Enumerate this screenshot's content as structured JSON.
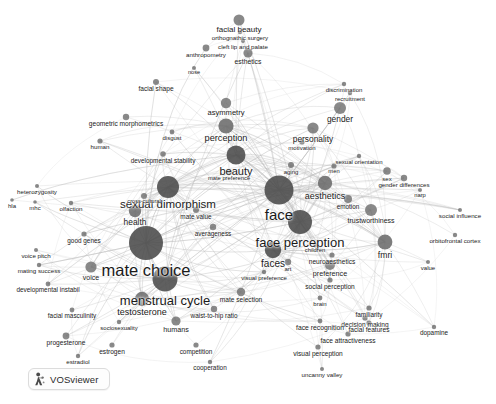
{
  "app": {
    "logo_label": "VOSviewer",
    "logo_icon": "vosviewer-logo-icon"
  },
  "canvas": {
    "width": 496,
    "height": 404,
    "background_color": "#ffffff",
    "node_color": "#6b6b6b",
    "node_color_dark": "#4a4a4a",
    "edge_color": "#b9b9b9",
    "label_color": "#1a1a1a"
  },
  "bottom_caption": "",
  "chart_data": {
    "type": "scatter",
    "title": "",
    "xlabel": "",
    "ylabel": "",
    "grid": false,
    "legend": "none",
    "xlim": [
      0,
      496
    ],
    "ylim": [
      0,
      404
    ],
    "nodes": [
      {
        "label": "facial beauty",
        "x": 239,
        "y": 20,
        "r": 5.5,
        "fs": 8.0
      },
      {
        "label": "orthognathic surgery",
        "x": 240,
        "y": 32,
        "r": 2.2,
        "fs": 6.2
      },
      {
        "label": "cleft lip and palate",
        "x": 243,
        "y": 41,
        "r": 2.0,
        "fs": 6.2
      },
      {
        "label": "esthetics",
        "x": 248,
        "y": 53,
        "r": 4.6,
        "fs": 6.8
      },
      {
        "label": "anthropometry",
        "x": 206,
        "y": 48,
        "r": 3.4,
        "fs": 6.2
      },
      {
        "label": "nose",
        "x": 194,
        "y": 68,
        "r": 2.0,
        "fs": 5.6
      },
      {
        "label": "facial shape",
        "x": 156,
        "y": 82,
        "r": 3.0,
        "fs": 6.6
      },
      {
        "label": "asymmetry",
        "x": 226,
        "y": 103,
        "r": 5.2,
        "fs": 7.6
      },
      {
        "label": "geometric morphometrics",
        "x": 126,
        "y": 117,
        "r": 3.2,
        "fs": 6.6
      },
      {
        "label": "perception",
        "x": 226,
        "y": 126,
        "r": 7.6,
        "fs": 9.2
      },
      {
        "label": "disgust",
        "x": 172,
        "y": 132,
        "r": 2.4,
        "fs": 6.0
      },
      {
        "label": "human",
        "x": 100,
        "y": 141,
        "r": 2.6,
        "fs": 6.2
      },
      {
        "label": "developmental stability",
        "x": 163,
        "y": 154,
        "r": 2.8,
        "fs": 6.4
      },
      {
        "label": "beauty",
        "x": 236,
        "y": 155,
        "r": 9.5,
        "fs": 11.0
      },
      {
        "label": "discrimination",
        "x": 344,
        "y": 84,
        "r": 2.2,
        "fs": 6.0
      },
      {
        "label": "recruitment",
        "x": 350,
        "y": 93,
        "r": 2.2,
        "fs": 6.0
      },
      {
        "label": "gender",
        "x": 340,
        "y": 108,
        "r": 6.0,
        "fs": 8.4
      },
      {
        "label": "personality",
        "x": 313,
        "y": 128,
        "r": 5.6,
        "fs": 8.4
      },
      {
        "label": "motivation",
        "x": 302,
        "y": 142,
        "r": 2.6,
        "fs": 6.0
      },
      {
        "label": "sexual orientation",
        "x": 359,
        "y": 156,
        "r": 2.2,
        "fs": 6.0
      },
      {
        "label": "men",
        "x": 334,
        "y": 166,
        "r": 2.6,
        "fs": 5.8
      },
      {
        "label": "aging",
        "x": 291,
        "y": 165,
        "r": 3.0,
        "fs": 6.0
      },
      {
        "label": "sex",
        "x": 387,
        "y": 171,
        "r": 3.8,
        "fs": 6.0
      },
      {
        "label": "gender differences",
        "x": 404,
        "y": 178,
        "r": 3.2,
        "fs": 6.2
      },
      {
        "label": "aesthetics",
        "x": 325,
        "y": 183,
        "r": 7.2,
        "fs": 9.0
      },
      {
        "label": "narp",
        "x": 420,
        "y": 190,
        "r": 2.0,
        "fs": 5.8
      },
      {
        "label": "heterozygosity",
        "x": 37,
        "y": 186,
        "r": 2.0,
        "fs": 6.2
      },
      {
        "label": "hla",
        "x": 12,
        "y": 200,
        "r": 1.8,
        "fs": 6.0
      },
      {
        "label": "mhc",
        "x": 35,
        "y": 202,
        "r": 1.8,
        "fs": 6.0
      },
      {
        "label": "olfaction",
        "x": 71,
        "y": 203,
        "r": 2.2,
        "fs": 6.2
      },
      {
        "label": "sexual dimorphism",
        "x": 168,
        "y": 187,
        "r": 11.0,
        "fs": 11.5
      },
      {
        "label": "cross-cultural",
        "x": 144,
        "y": 196,
        "r": 3.0,
        "fs": 5.6
      },
      {
        "label": "health",
        "x": 135,
        "y": 211,
        "r": 6.2,
        "fs": 8.4
      },
      {
        "label": "mate value",
        "x": 196,
        "y": 210,
        "r": 3.0,
        "fs": 6.4
      },
      {
        "label": "mate preference",
        "x": 229,
        "y": 172,
        "r": 3.0,
        "fs": 5.8
      },
      {
        "label": "face",
        "x": 279,
        "y": 190,
        "r": 14.5,
        "fs": 15.0
      },
      {
        "label": "emotion",
        "x": 348,
        "y": 199,
        "r": 4.0,
        "fs": 6.4
      },
      {
        "label": "trustworthiness",
        "x": 371,
        "y": 210,
        "r": 6.0,
        "fs": 7.0
      },
      {
        "label": "social influence",
        "x": 460,
        "y": 210,
        "r": 2.0,
        "fs": 6.2
      },
      {
        "label": "orbitofrontal cortex",
        "x": 455,
        "y": 235,
        "r": 2.2,
        "fs": 6.2
      },
      {
        "label": "averageness",
        "x": 213,
        "y": 227,
        "r": 3.2,
        "fs": 6.4
      },
      {
        "label": "face perception",
        "x": 300,
        "y": 222,
        "r": 12.0,
        "fs": 13.0
      },
      {
        "label": "mate choice",
        "x": 146,
        "y": 243,
        "r": 17.0,
        "fs": 16.5
      },
      {
        "label": "good genes",
        "x": 84,
        "y": 234,
        "r": 2.6,
        "fs": 6.4
      },
      {
        "label": "voice pitch",
        "x": 36,
        "y": 250,
        "r": 2.0,
        "fs": 6.2
      },
      {
        "label": "mating success",
        "x": 39,
        "y": 265,
        "r": 2.2,
        "fs": 6.2
      },
      {
        "label": "voice",
        "x": 91,
        "y": 267,
        "r": 5.6,
        "fs": 7.0
      },
      {
        "label": "faces",
        "x": 273,
        "y": 250,
        "r": 8.2,
        "fs": 10.0
      },
      {
        "label": "fmri",
        "x": 385,
        "y": 242,
        "r": 7.4,
        "fs": 8.6
      },
      {
        "label": "children",
        "x": 315,
        "y": 245,
        "r": 2.4,
        "fs": 5.8
      },
      {
        "label": "neuroaesthetics",
        "x": 332,
        "y": 255,
        "r": 2.6,
        "fs": 6.6
      },
      {
        "label": "preference",
        "x": 330,
        "y": 265,
        "r": 5.0,
        "fs": 7.2
      },
      {
        "label": "value",
        "x": 428,
        "y": 262,
        "r": 2.0,
        "fs": 6.0
      },
      {
        "label": "art",
        "x": 288,
        "y": 262,
        "r": 3.2,
        "fs": 6.0
      },
      {
        "label": "visual preference",
        "x": 264,
        "y": 272,
        "r": 2.2,
        "fs": 6.0
      },
      {
        "label": "developmental instabil",
        "x": 48,
        "y": 284,
        "r": 2.4,
        "fs": 6.4
      },
      {
        "label": "social perception",
        "x": 330,
        "y": 280,
        "r": 2.6,
        "fs": 6.6
      },
      {
        "label": "menstrual cycle",
        "x": 165,
        "y": 279,
        "r": 12.5,
        "fs": 13.0
      },
      {
        "label": "testosterone",
        "x": 142,
        "y": 299,
        "r": 7.2,
        "fs": 9.0
      },
      {
        "label": "mate selection",
        "x": 241,
        "y": 292,
        "r": 4.2,
        "fs": 6.6
      },
      {
        "label": "waist-to-hip ratio",
        "x": 214,
        "y": 309,
        "r": 3.2,
        "fs": 6.4
      },
      {
        "label": "brain",
        "x": 320,
        "y": 298,
        "r": 2.4,
        "fs": 6.0
      },
      {
        "label": "familiarity",
        "x": 369,
        "y": 308,
        "r": 2.6,
        "fs": 6.4
      },
      {
        "label": "facial masculinity",
        "x": 72,
        "y": 310,
        "r": 2.4,
        "fs": 6.4
      },
      {
        "label": "sociosexuality",
        "x": 119,
        "y": 322,
        "r": 2.2,
        "fs": 6.0
      },
      {
        "label": "humans",
        "x": 176,
        "y": 321,
        "r": 4.6,
        "fs": 7.2
      },
      {
        "label": "decision making",
        "x": 365,
        "y": 318,
        "r": 2.6,
        "fs": 6.6
      },
      {
        "label": "face recognition",
        "x": 320,
        "y": 321,
        "r": 2.4,
        "fs": 6.8
      },
      {
        "label": "facial features",
        "x": 369,
        "y": 323,
        "r": 2.6,
        "fs": 6.6
      },
      {
        "label": "dopamine",
        "x": 434,
        "y": 327,
        "r": 2.2,
        "fs": 6.4
      },
      {
        "label": "progesterone",
        "x": 66,
        "y": 336,
        "r": 3.4,
        "fs": 6.6
      },
      {
        "label": "face attractiveness",
        "x": 348,
        "y": 334,
        "r": 2.6,
        "fs": 6.6
      },
      {
        "label": "estrogen",
        "x": 112,
        "y": 345,
        "r": 2.6,
        "fs": 6.6
      },
      {
        "label": "competition",
        "x": 196,
        "y": 345,
        "r": 2.6,
        "fs": 6.4
      },
      {
        "label": "estradiol",
        "x": 78,
        "y": 356,
        "r": 2.2,
        "fs": 6.2
      },
      {
        "label": "visual perception",
        "x": 318,
        "y": 347,
        "r": 2.6,
        "fs": 6.6
      },
      {
        "label": "cooperation",
        "x": 210,
        "y": 362,
        "r": 2.2,
        "fs": 6.4
      },
      {
        "label": "uncanny valley",
        "x": 322,
        "y": 369,
        "r": 2.0,
        "fs": 6.2
      }
    ]
  }
}
